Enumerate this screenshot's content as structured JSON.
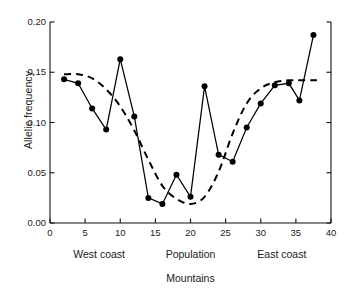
{
  "chart_data": {
    "type": "line",
    "title": "",
    "subtitle": "",
    "xlabel": "Mountains",
    "ylabel": "Allelic frequency",
    "xlim": [
      0,
      40
    ],
    "ylim": [
      0.0,
      0.2
    ],
    "grid": false,
    "legend": "none",
    "xticks": [
      0,
      5,
      10,
      15,
      20,
      25,
      30,
      35,
      40
    ],
    "xticklabels": [
      "0",
      "5",
      "10",
      "15",
      "20",
      "25",
      "30",
      "35",
      "40"
    ],
    "yticks": [
      0.0,
      0.05,
      0.1,
      0.15,
      0.2
    ],
    "yticklabels": [
      "0.00",
      "0.05",
      "0.10",
      "0.15",
      "0.20"
    ],
    "region_labels": [
      {
        "text": "West coast",
        "x": 7
      },
      {
        "text": "Population",
        "x": 20
      },
      {
        "text": "East coast",
        "x": 33
      }
    ],
    "series": [
      {
        "name": "Observed allelic frequency",
        "style": "solid-with-markers",
        "marker": "filled-circle",
        "color": "#000000",
        "x": [
          2,
          4,
          6,
          8,
          10,
          12,
          14,
          16,
          18,
          20,
          22,
          24,
          26,
          28,
          30,
          32,
          34,
          35.5,
          37.5
        ],
        "y": [
          0.143,
          0.139,
          0.114,
          0.093,
          0.163,
          0.106,
          0.025,
          0.019,
          0.048,
          0.026,
          0.136,
          0.068,
          0.061,
          0.095,
          0.119,
          0.137,
          0.139,
          0.122,
          0.187
        ]
      },
      {
        "name": "Fitted cline (smoothed)",
        "style": "dashed",
        "marker": "none",
        "color": "#000000",
        "x": [
          2,
          4,
          6,
          8,
          10,
          12,
          14,
          16,
          18,
          20,
          22,
          24,
          26,
          28,
          30,
          32,
          34,
          36,
          38
        ],
        "y": [
          0.148,
          0.148,
          0.144,
          0.133,
          0.116,
          0.092,
          0.063,
          0.037,
          0.024,
          0.019,
          0.026,
          0.051,
          0.089,
          0.119,
          0.134,
          0.14,
          0.142,
          0.142,
          0.142
        ]
      }
    ]
  },
  "axes": {
    "left_spine": true,
    "bottom_spine": true,
    "right_spine": true,
    "top_spine": false
  }
}
